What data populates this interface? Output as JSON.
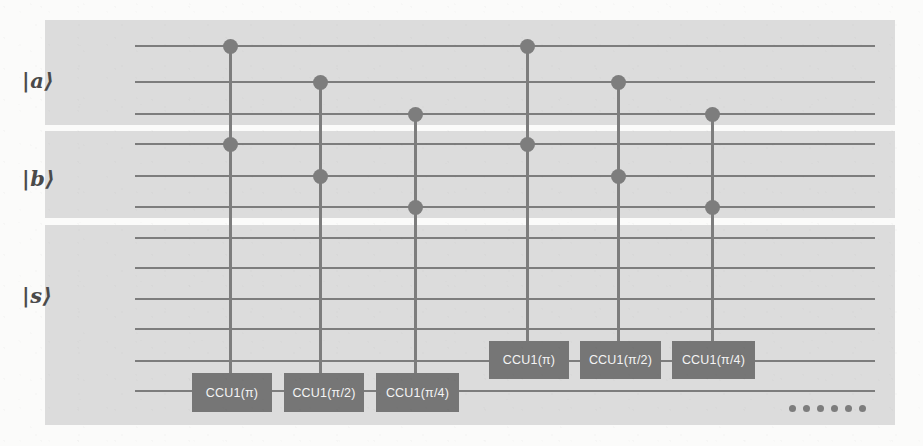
{
  "figure": {
    "type": "quantum-circuit-diagram",
    "background_color": "#fbfbfa",
    "register_band_color": "#dcdcdc",
    "wire_color": "#7d7d7d",
    "gate_fill_color": "#767676",
    "gate_text_color": "#f4f4f4",
    "control_dot_color": "#7d7d7d"
  },
  "registers": [
    {
      "id": "a",
      "label": "|a⟩",
      "wire_count": 3,
      "label_x": 22,
      "label_y": 68,
      "band": {
        "x": 45,
        "y": 20,
        "w": 850,
        "h": 105
      },
      "wire_y": [
        45,
        81,
        113
      ]
    },
    {
      "id": "b",
      "label": "|b⟩",
      "wire_count": 3,
      "label_x": 22,
      "label_y": 166,
      "band": {
        "x": 45,
        "y": 131,
        "w": 850,
        "h": 87
      },
      "wire_y": [
        143,
        175,
        206
      ]
    },
    {
      "id": "s",
      "label": "|s⟩",
      "wire_count": 6,
      "label_x": 22,
      "label_y": 283,
      "band": {
        "x": 45,
        "y": 225,
        "w": 850,
        "h": 200
      },
      "wire_y": [
        237,
        267,
        298,
        328,
        360,
        390
      ]
    }
  ],
  "wire_span": {
    "x_start": 135,
    "x_end": 875
  },
  "columns": [
    {
      "id": "col-1",
      "x": 230,
      "gate_label": "CCU1(π)",
      "gate_x": 192,
      "gate_y": 373,
      "gate_w": 80,
      "gate_h": 39,
      "target_wire_y": 390,
      "controls_y": [
        45,
        143
      ]
    },
    {
      "id": "col-2",
      "x": 320,
      "gate_label": "CCU1(π/2)",
      "gate_x": 284,
      "gate_y": 373,
      "gate_w": 80,
      "gate_h": 39,
      "target_wire_y": 390,
      "controls_y": [
        81,
        175
      ]
    },
    {
      "id": "col-3",
      "x": 415,
      "gate_label": "CCU1(π/4)",
      "gate_x": 376,
      "gate_y": 373,
      "gate_w": 83,
      "gate_h": 39,
      "target_wire_y": 390,
      "controls_y": [
        113,
        206
      ]
    },
    {
      "id": "col-4",
      "x": 527,
      "gate_label": "CCU1(π)",
      "gate_x": 489,
      "gate_y": 341,
      "gate_w": 80,
      "gate_h": 38,
      "target_wire_y": 360,
      "controls_y": [
        45,
        143
      ]
    },
    {
      "id": "col-5",
      "x": 618,
      "gate_label": "CCU1(π/2)",
      "gate_x": 580,
      "gate_y": 341,
      "gate_w": 81,
      "gate_h": 38,
      "target_wire_y": 360,
      "controls_y": [
        81,
        175
      ]
    },
    {
      "id": "col-6",
      "x": 712,
      "gate_label": "CCU1(π/4)",
      "gate_x": 672,
      "gate_y": 341,
      "gate_w": 83,
      "gate_h": 38,
      "target_wire_y": 360,
      "controls_y": [
        113,
        206
      ]
    }
  ],
  "ellipsis": {
    "x": 789,
    "y": 405,
    "dot_count": 6,
    "label": "…"
  },
  "gate_labels": [
    "CCU1(π)",
    "CCU1(π/2)",
    "CCU1(π/4)",
    "CCU1(π)",
    "CCU1(π/2)",
    "CCU1(π/4)"
  ]
}
